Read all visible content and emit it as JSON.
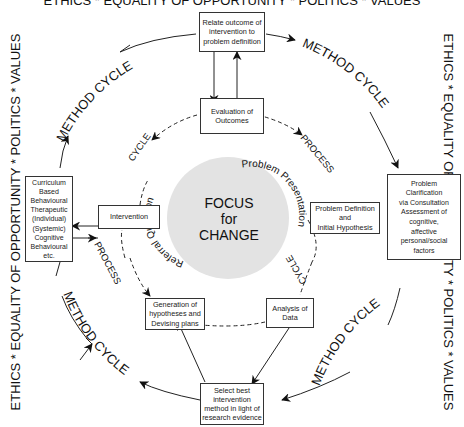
{
  "frame": {
    "top": "ETHICS * EQUALITY OF OPPORTUNITY * POLITICS * VALUES",
    "left": "ETHICS * EQUALITY OF OPPORTUNITY * POLITICS * VALUES",
    "right": "ETHICS * EQUALITY OF OPPORTUNITY * POLITICS * VALUES"
  },
  "center": {
    "line1": "FOCUS",
    "line2": "for",
    "line3": "CHANGE",
    "arc_left": "Referral Question",
    "arc_right": "Problem Presentation",
    "fill": "#e3e3e3"
  },
  "outer_cycle": {
    "labels": [
      "METHOD CYCLE",
      "METHOD CYCLE",
      "METHOD CYCLE",
      "METHOD CYCLE"
    ]
  },
  "inner_cycle": {
    "labels": [
      "CYCLE",
      "PROCESS",
      "CYCLE",
      "PROCESS"
    ]
  },
  "boxes": {
    "relate": [
      "Relate outcome of",
      "intervention to",
      "problem definition"
    ],
    "evaluation": [
      "Evaluation of",
      "Outcomes"
    ],
    "problem_clarification": [
      "Problem",
      "Clarification",
      "via Consultation",
      "Assessment of",
      "cognitive,",
      "affective",
      "personal/social",
      "factors"
    ],
    "problem_definition": [
      "Problem Definition",
      "and",
      "Initial Hypothesis"
    ],
    "analysis": [
      "Analysis of",
      "Data"
    ],
    "select": [
      "Select best",
      "intervention",
      "method in light of",
      "research evidence"
    ],
    "generation": [
      "Generation of",
      "hypotheses and",
      "Devising plans"
    ],
    "intervention": [
      "Intervention"
    ],
    "curriculum": [
      "Curriculum",
      "Based",
      "Behavioural",
      "Therapeutic",
      "(Individual)",
      "(Systemic)",
      "Cognitive",
      "Behavioural",
      "etc."
    ]
  }
}
